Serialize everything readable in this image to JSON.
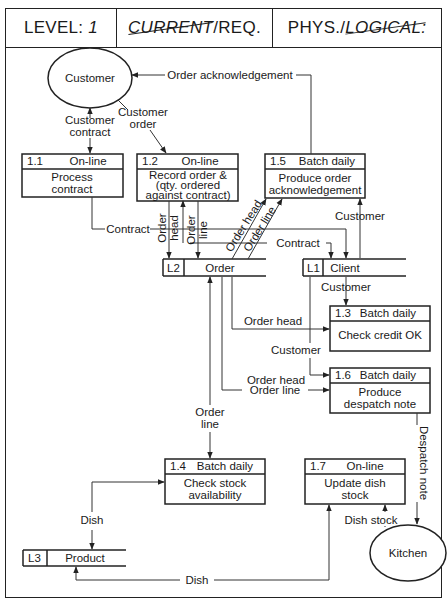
{
  "header": {
    "level_label": "LEVEL:",
    "level_value": "1",
    "current_struck": "CURRENT",
    "req": "/REQ.",
    "phys": "PHYS./",
    "logical_struck": "LOGICAL:"
  },
  "externals": [
    {
      "id": "customer",
      "label": "Customer"
    },
    {
      "id": "kitchen",
      "label": "Kitchen"
    }
  ],
  "processes": [
    {
      "id": "1.1",
      "type": "On-line",
      "lines": [
        "Process",
        "contract"
      ]
    },
    {
      "id": "1.2",
      "type": "On-line",
      "lines": [
        "Record order &",
        "(qty. ordered",
        "against contract)"
      ]
    },
    {
      "id": "1.3",
      "type": "Batch daily",
      "lines": [
        "Check credit OK"
      ]
    },
    {
      "id": "1.4",
      "type": "Batch daily",
      "lines": [
        "Check stock",
        "availability"
      ]
    },
    {
      "id": "1.5",
      "type": "Batch daily",
      "lines": [
        "Produce order",
        "acknowledgement"
      ]
    },
    {
      "id": "1.6",
      "type": "Batch daily",
      "lines": [
        "Produce",
        "despatch note"
      ]
    },
    {
      "id": "1.7",
      "type": "On-line",
      "lines": [
        "Update dish",
        "stock"
      ]
    }
  ],
  "stores": [
    {
      "id": "L2",
      "label": "Order"
    },
    {
      "id": "L1",
      "label": "Client"
    },
    {
      "id": "L3",
      "label": "Product"
    }
  ],
  "flows": {
    "order_ack": "Order acknowledgement",
    "customer_contract_1": "Customer",
    "customer_contract_2": "contract",
    "customer_order_1": "Customer",
    "customer_order_2": "order",
    "contract_a": "Contract",
    "contract_b": "Contract",
    "order_head_v1": "Order",
    "order_head_v2": "head",
    "order_line_v1": "Order",
    "order_line_v2": "line",
    "order_head_diag": "Order head",
    "order_line_diag": "Order line",
    "customer_to_15": "Customer",
    "customer_to_13": "Customer",
    "order_head_to_13": "Order head",
    "customer_to_16": "Customer",
    "order_head_to_16": "Order head",
    "order_line_to_16": "Order line",
    "order_line_to_14_1": "Order",
    "order_line_to_14_2": "line",
    "dish_14": "Dish",
    "dish_17": "Dish",
    "dish_stock": "Dish stock",
    "despatch_note": "Despatch note"
  }
}
